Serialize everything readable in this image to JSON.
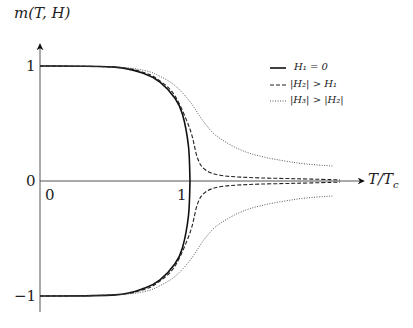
{
  "chart_data": {
    "type": "line",
    "title": "",
    "xlabel": "T/T_c",
    "ylabel": "m(T, H)",
    "xlim": [
      0,
      2.0
    ],
    "ylim": [
      -1.1,
      1.1
    ],
    "x_ticks": [
      {
        "value": 0,
        "label": "0"
      },
      {
        "value": 1,
        "label": "1"
      }
    ],
    "y_ticks": [
      {
        "value": 1,
        "label": "1"
      },
      {
        "value": 0,
        "label": "0"
      },
      {
        "value": -1,
        "label": "−1"
      }
    ],
    "grid": false,
    "legend_position": "upper right",
    "series": [
      {
        "name": "H1 = 0",
        "label": "H₁ = 0",
        "style": "solid",
        "x": [
          0,
          0.5,
          0.7,
          0.8,
          0.9,
          0.95,
          0.99,
          1.0
        ],
        "y_upper": [
          1,
          0.99,
          0.93,
          0.86,
          0.72,
          0.58,
          0.3,
          0
        ],
        "y_lower": [
          -1,
          -0.99,
          -0.93,
          -0.86,
          -0.72,
          -0.58,
          -0.3,
          0
        ]
      },
      {
        "name": "|H2| > H1",
        "label": "|H₂| > H₁",
        "style": "dashed",
        "x": [
          0,
          0.5,
          0.7,
          0.8,
          0.9,
          1.0,
          1.05,
          1.1,
          1.2,
          1.4,
          1.7,
          2.0
        ],
        "y_upper": [
          1,
          0.99,
          0.94,
          0.87,
          0.74,
          0.45,
          0.2,
          0.1,
          0.05,
          0.03,
          0.02,
          0.01
        ],
        "y_lower": [
          -1,
          -0.99,
          -0.94,
          -0.87,
          -0.74,
          -0.45,
          -0.2,
          -0.1,
          -0.05,
          -0.03,
          -0.02,
          -0.01
        ]
      },
      {
        "name": "|H3| > |H2|",
        "label": "|H₃| > |H₂|",
        "style": "dotted",
        "x": [
          0,
          0.5,
          0.7,
          0.8,
          0.9,
          1.0,
          1.1,
          1.2,
          1.4,
          1.7,
          1.95
        ],
        "y_upper": [
          1,
          0.99,
          0.96,
          0.91,
          0.83,
          0.69,
          0.5,
          0.37,
          0.24,
          0.16,
          0.13
        ],
        "y_lower": [
          -1,
          -0.99,
          -0.96,
          -0.91,
          -0.83,
          -0.69,
          -0.5,
          -0.37,
          -0.24,
          -0.16,
          -0.13
        ]
      }
    ]
  },
  "labels": {
    "ylabel": "m(T, H)",
    "xlabel": "T/T",
    "xlabel_sub": "c",
    "ytick_1": "1",
    "ytick_0": "0",
    "ytick_m1": "−1",
    "xtick_0": "0",
    "xtick_1": "1"
  },
  "legend": [
    {
      "label": "H₁ = 0"
    },
    {
      "label": "|H₂| >  H₁"
    },
    {
      "label": "|H₃| > |H₂|"
    }
  ]
}
